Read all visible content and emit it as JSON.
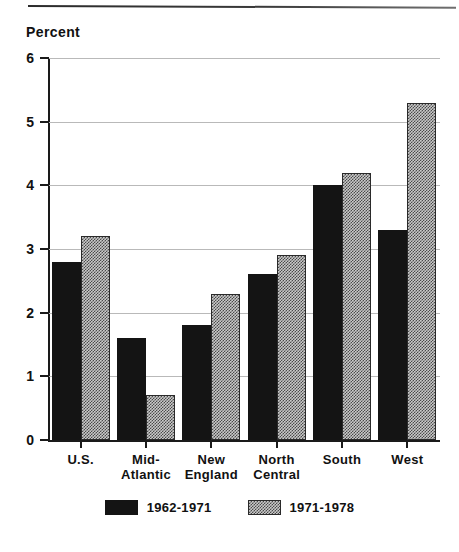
{
  "page": {
    "top_rule": "horizontal-rule"
  },
  "chart_data": {
    "type": "bar",
    "title": "",
    "xlabel": "",
    "ylabel": "Percent",
    "ylim": [
      0,
      6
    ],
    "yticks": [
      0,
      1,
      2,
      3,
      4,
      5,
      6
    ],
    "ytick_labels": [
      "0",
      "1",
      "2",
      "3",
      "4",
      "5",
      "6"
    ],
    "grid": true,
    "grid_axis": "y",
    "legend_position": "bottom-center",
    "categories": [
      "U.S.",
      "Mid-\nAtlantic",
      "New\nEngland",
      "North\nCentral",
      "South",
      "West"
    ],
    "series": [
      {
        "name": "1962-1971",
        "fill": "solid-black",
        "color": "#141414",
        "values": [
          2.8,
          1.6,
          1.8,
          2.6,
          4.0,
          3.3
        ]
      },
      {
        "name": "1971-1978",
        "fill": "gray-dither-hatch",
        "color": "#c9c9c9",
        "values": [
          3.2,
          0.7,
          2.3,
          2.9,
          4.2,
          5.3
        ]
      }
    ]
  }
}
